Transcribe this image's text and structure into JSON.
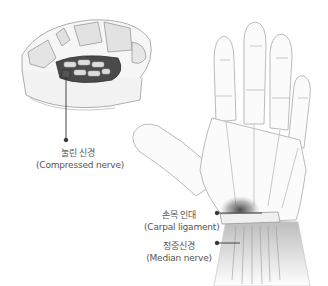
{
  "figure": {
    "callouts": [
      {
        "id": "compressed-nerve",
        "ko": "눌린 신경",
        "en": "(Compressed nerve)"
      },
      {
        "id": "carpal-ligament",
        "ko": "손목 인대",
        "en": "(Carpal ligament)"
      },
      {
        "id": "median-nerve",
        "ko": "정중신경",
        "en": "(Median nerve)"
      }
    ],
    "colors": {
      "line": "#333333",
      "sketch": "#9a9a9a",
      "shade": "#555555",
      "text": "#555555"
    }
  }
}
